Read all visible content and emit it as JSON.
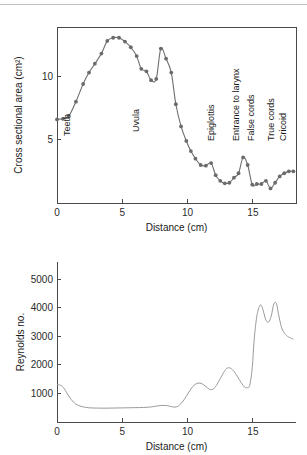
{
  "figure": {
    "background": "#ffffff",
    "line_color": "#6e6e6e",
    "marker_color": "#6b6b6b",
    "axis_color": "#4a4a4a"
  },
  "chart_data": [
    {
      "id": "cross-sectional-area",
      "type": "scatter",
      "title": "",
      "xlabel": "Distance (cm)",
      "ylabel": "Cross sectional area (cm²)",
      "xlim": [
        0,
        18.3
      ],
      "ylim": [
        0,
        13.9
      ],
      "xticks": [
        0,
        5,
        10,
        15
      ],
      "xticklabels": [
        "0",
        "5",
        "10",
        "15"
      ],
      "yticks": [
        5,
        10
      ],
      "yticklabels": [
        "5",
        "10"
      ],
      "grid": false,
      "legend": "none",
      "markers": true,
      "x": [
        0.0,
        0.45,
        0.9,
        1.45,
        2.0,
        2.45,
        2.9,
        3.4,
        3.85,
        4.3,
        4.75,
        5.2,
        5.65,
        6.1,
        6.45,
        6.85,
        7.2,
        7.6,
        7.95,
        8.35,
        8.75,
        9.1,
        9.5,
        9.9,
        10.25,
        10.6,
        11.0,
        11.4,
        11.8,
        12.15,
        12.5,
        12.85,
        13.2,
        13.55,
        13.9,
        14.25,
        14.6,
        14.95,
        15.3,
        15.65,
        16.0,
        16.35,
        16.7,
        17.05,
        17.4,
        17.75,
        18.1
      ],
      "y": [
        6.6,
        6.65,
        6.85,
        8.0,
        9.4,
        10.3,
        11.0,
        11.8,
        12.8,
        13.05,
        13.05,
        12.75,
        12.3,
        11.6,
        10.6,
        10.4,
        9.7,
        9.8,
        12.2,
        11.4,
        10.3,
        7.8,
        6.05,
        4.9,
        4.1,
        3.5,
        3.0,
        2.95,
        3.15,
        2.2,
        1.75,
        1.55,
        1.6,
        2.0,
        2.35,
        3.6,
        3.0,
        1.45,
        1.5,
        1.5,
        1.75,
        1.15,
        1.6,
        2.1,
        2.35,
        2.5,
        2.5
      ],
      "annotations": [
        {
          "text": "Teeth",
          "x": 1.0,
          "y": 5.3
        },
        {
          "text": "Uvula",
          "x": 6.3,
          "y": 5.6
        },
        {
          "text": "Epiglottis",
          "x": 12.0,
          "y": 4.9
        },
        {
          "text": "Entrance to larynx",
          "x": 13.95,
          "y": 4.9
        },
        {
          "text": "False cords",
          "x": 15.1,
          "y": 4.9
        },
        {
          "text": "True cords",
          "x": 16.6,
          "y": 4.9
        },
        {
          "text": "Cricoid",
          "x": 17.55,
          "y": 4.9
        }
      ]
    },
    {
      "id": "reynolds-number",
      "type": "line",
      "title": "",
      "xlabel": "Distance (cm)",
      "ylabel": "Reynolds no.",
      "xlim": [
        0,
        18.3
      ],
      "ylim": [
        0,
        5600
      ],
      "xticks": [
        0,
        5,
        10,
        15
      ],
      "xticklabels": [
        "0",
        "5",
        "10",
        "15"
      ],
      "yticks": [
        1000,
        2000,
        3000,
        4000,
        5000
      ],
      "yticklabels": [
        "1000",
        "2000",
        "3000",
        "4000",
        "5000"
      ],
      "grid": false,
      "legend": "none",
      "markers": false,
      "x": [
        0.0,
        0.25,
        0.5,
        0.8,
        1.1,
        1.4,
        1.7,
        2.0,
        2.4,
        2.8,
        3.3,
        3.9,
        4.5,
        5.1,
        5.7,
        6.3,
        6.9,
        7.4,
        7.8,
        8.1,
        8.4,
        8.7,
        9.0,
        9.3,
        9.6,
        9.9,
        10.2,
        10.5,
        10.8,
        11.1,
        11.4,
        11.7,
        11.95,
        12.2,
        12.5,
        12.8,
        13.0,
        13.25,
        13.5,
        13.8,
        14.1,
        14.35,
        14.55,
        14.75,
        14.95,
        15.1,
        15.3,
        15.5,
        15.65,
        15.8,
        16.0,
        16.2,
        16.4,
        16.6,
        16.8,
        16.95,
        17.2,
        17.5,
        17.8,
        18.1
      ],
      "y": [
        1310,
        1290,
        1200,
        980,
        780,
        640,
        570,
        530,
        500,
        490,
        485,
        485,
        490,
        495,
        500,
        505,
        515,
        540,
        570,
        580,
        575,
        545,
        520,
        560,
        700,
        900,
        1120,
        1290,
        1360,
        1340,
        1240,
        1140,
        1150,
        1280,
        1520,
        1760,
        1880,
        1890,
        1800,
        1600,
        1380,
        1230,
        1200,
        1280,
        1900,
        2900,
        3700,
        4050,
        4080,
        3880,
        3560,
        3500,
        3700,
        4130,
        4150,
        3800,
        3300,
        3060,
        2960,
        2900
      ]
    }
  ]
}
